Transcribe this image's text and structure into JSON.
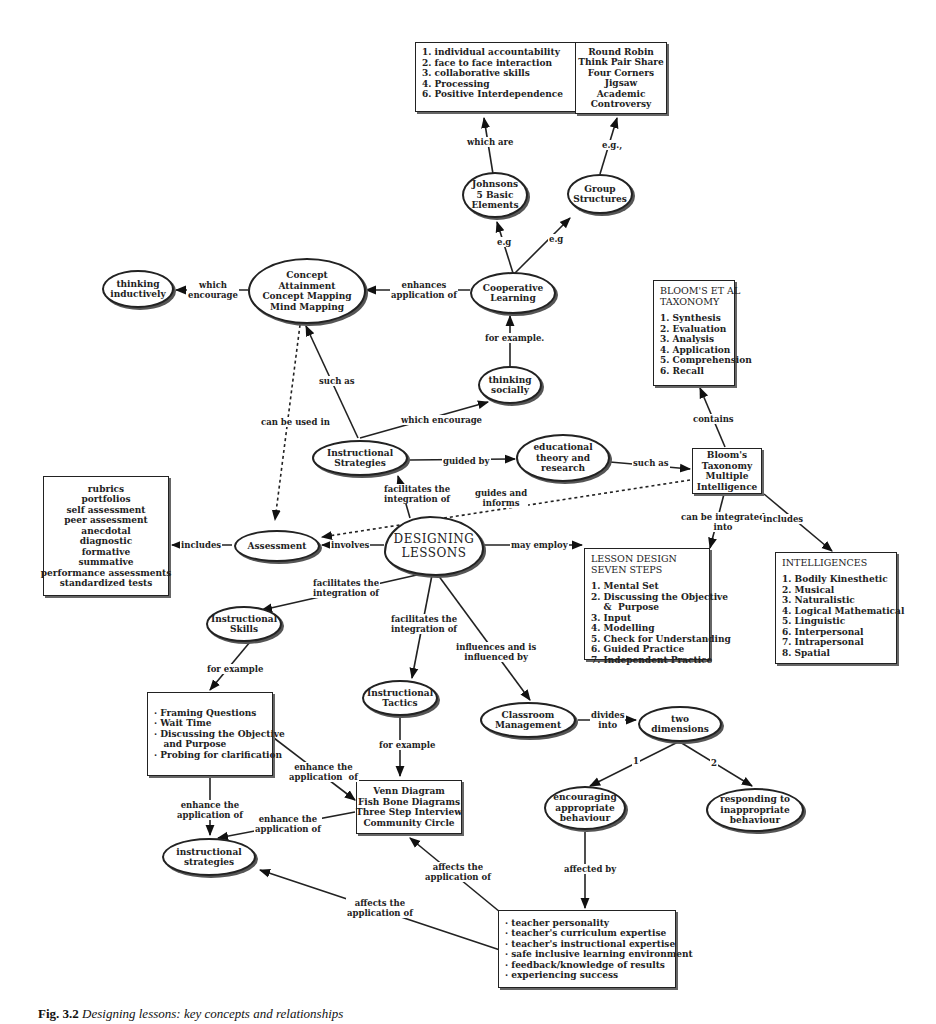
{
  "nodes": {
    "elements_list": {
      "lines": [
        "1. individual accountability",
        "2. face to face interaction",
        "3. collaborative skills",
        "4. Processing",
        "6. Positive Interdependence"
      ]
    },
    "structures_list": {
      "lines": [
        "Round Robin",
        "Think Pair Share",
        "Four Corners",
        "Jigsaw",
        "Academic",
        "Controversy"
      ]
    },
    "johnsons": {
      "lines": [
        "Johnsons",
        "5 Basic",
        "Elements"
      ]
    },
    "group_structures": {
      "lines": [
        "Group",
        "Structures"
      ]
    },
    "thinking_inductively": {
      "lines": [
        "thinking",
        "inductively"
      ]
    },
    "concept_attainment": {
      "lines": [
        "Concept",
        "Attainment",
        "Concept Mapping",
        "Mind Mapping"
      ]
    },
    "cooperative_learning": {
      "lines": [
        "Cooperative",
        "Learning"
      ]
    },
    "blooms_taxonomy_box": {
      "title_lines": [
        "BLOOM'S ET AL",
        "TAXONOMY"
      ],
      "lines": [
        "1. Synthesis",
        "2. Evaluation",
        "3. Analysis",
        "4. Application",
        "5. Comprehension",
        "6. Recall"
      ]
    },
    "thinking_socially": {
      "lines": [
        "thinking",
        "socially"
      ]
    },
    "instructional_strategies_top": {
      "lines": [
        "Instructional",
        "Strategies"
      ]
    },
    "educational_theory": {
      "lines": [
        "educational",
        "theory and",
        "research"
      ]
    },
    "blooms_mi": {
      "lines": [
        "Bloom's",
        "Taxonomy",
        "Multiple",
        "Intelligence"
      ]
    },
    "assessment_list": {
      "lines": [
        "rubrics",
        "portfolios",
        "self assessment",
        "peer assessment",
        "anecdotal",
        "diagnostic",
        "formative",
        "summative",
        "performance assessments",
        "standardized tests"
      ]
    },
    "assessment": {
      "lines": [
        "Assessment"
      ]
    },
    "designing_lessons": {
      "lines": [
        "DESIGNING",
        "LESSONS"
      ]
    },
    "lesson_design": {
      "title_lines": [
        "LESSON DESIGN",
        "SEVEN STEPS"
      ],
      "lines": [
        "1. Mental Set",
        "2. Discussing the Objective",
        "    &  Purpose",
        "3. Input",
        "4. Modelling",
        "5. Check for Understanding",
        "6. Guided Practice",
        "7. Independent Practice"
      ]
    },
    "intelligences": {
      "title_lines": [
        "INTELLIGENCES"
      ],
      "lines": [
        "1. Bodily Kinesthetic",
        "2. Musical",
        "3. Naturalistic",
        "4. Logical Mathematical",
        "5. Linguistic",
        "6. Interpersonal",
        "7. Intrapersonal",
        "8. Spatial"
      ]
    },
    "instructional_skills": {
      "lines": [
        "Instructional",
        "Skills"
      ]
    },
    "instructional_tactics": {
      "lines": [
        "Instructional",
        "Tactics"
      ]
    },
    "classroom_management": {
      "lines": [
        "Classroom",
        "Management"
      ]
    },
    "two_dimensions": {
      "lines": [
        "two",
        "dimensions"
      ]
    },
    "skills_list": {
      "lines": [
        "· Framing Questions",
        "· Wait Time",
        "· Discussing the Objective",
        "   and Purpose",
        "· Probing for clarification"
      ]
    },
    "tactics_list": {
      "lines": [
        "Venn Diagram",
        "Fish Bone Diagrams",
        "Three Step Interview",
        "Community Circle"
      ]
    },
    "encouraging": {
      "lines": [
        "encouraging",
        "appropriate",
        "behaviour"
      ]
    },
    "responding": {
      "lines": [
        "responding to",
        "inappropriate",
        "behaviour"
      ]
    },
    "instructional_strategies_bottom": {
      "lines": [
        "instructional",
        "strategies"
      ]
    },
    "teacher_factors": {
      "lines": [
        "· teacher personality",
        "· teacher's curriculum expertise",
        "· teacher's instructional expertise",
        "· safe inclusive learning environment",
        "· feedback/knowledge of results",
        "· experiencing success"
      ]
    }
  },
  "edge_labels": {
    "which_are": [
      "which are"
    ],
    "eg_structures": [
      "e.g.,"
    ],
    "eg_johnsons": [
      "e.g"
    ],
    "eg_group": [
      "e.g"
    ],
    "which_encourage_top": [
      "which",
      "encourage"
    ],
    "enhances_application": [
      "enhances",
      "application of"
    ],
    "for_example_coop": [
      "for example."
    ],
    "such_as_concept": [
      "such as"
    ],
    "can_be_used_in": [
      "can be used in"
    ],
    "which_encourage_mid": [
      "which encourage"
    ],
    "contains": [
      "contains"
    ],
    "guided_by": [
      "guided by"
    ],
    "such_as_blooms": [
      "such as"
    ],
    "facilitates_integration_top": [
      "facilitates the",
      "integration of"
    ],
    "guides_and_informs": [
      "guides and",
      "informs"
    ],
    "can_be_integrated_into": [
      "can be integrated",
      "into"
    ],
    "includes_intelligences": [
      "includes"
    ],
    "includes_assessment": [
      "includes"
    ],
    "involves": [
      "involves"
    ],
    "may_employ": [
      "may employ"
    ],
    "facilitates_skills": [
      "facilitates the",
      "integration of"
    ],
    "facilitates_tactics": [
      "facilitates the",
      "integration of"
    ],
    "influences": [
      "influences and is",
      "influenced by"
    ],
    "for_example_skills": [
      "for example"
    ],
    "for_example_tactics": [
      "for example"
    ],
    "divides_into": [
      "divides",
      "into"
    ],
    "one": [
      "1"
    ],
    "two": [
      "2"
    ],
    "enhance_application_right": [
      "enhance the",
      "application  of"
    ],
    "enhance_application_left": [
      "enhance the",
      "application of"
    ],
    "enhance_application_mid": [
      "enhance the",
      "application of"
    ],
    "affected_by": [
      "affected by"
    ],
    "affects_tactics": [
      "affects the",
      "application of"
    ],
    "affects_strategies": [
      "affects the",
      "application of"
    ]
  },
  "caption": {
    "label": "Fig. 3.2",
    "text": "Designing lessons: key concepts and relationships"
  }
}
